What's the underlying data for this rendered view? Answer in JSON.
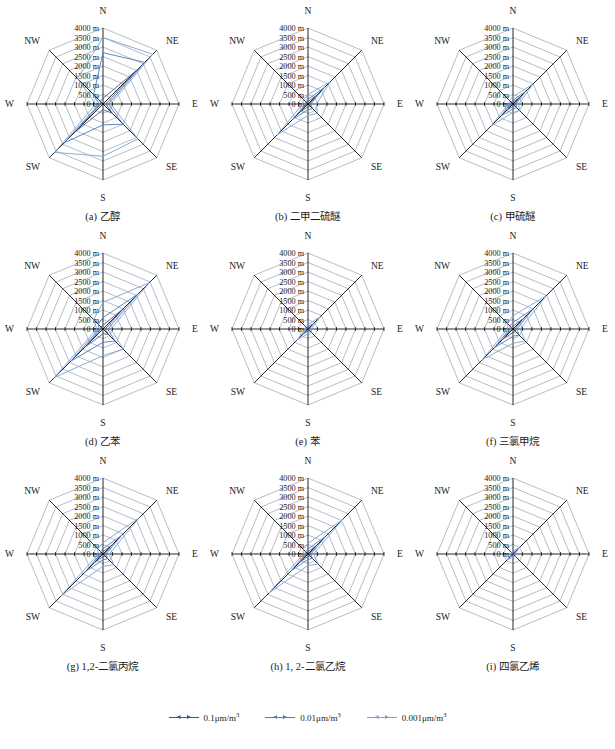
{
  "figure": {
    "rows": 3,
    "cols": 3,
    "grid_color": "#8a8fa3",
    "spoke_color": "#000000",
    "background": "#ffffff"
  },
  "legend": {
    "position": "bottom-center",
    "items": [
      {
        "label": "0.1μm/m",
        "sup": "3",
        "color": "#3d5a8c"
      },
      {
        "label": "0.01μm/m",
        "sup": "3",
        "color": "#4f7ab5"
      },
      {
        "label": "0.001μm/m",
        "sup": "3",
        "color": "#7aa3d4"
      }
    ]
  },
  "axis": {
    "directions": [
      "N",
      "NE",
      "E",
      "SE",
      "S",
      "SW",
      "W",
      "NW"
    ],
    "tick_labels": [
      "4000 m",
      "3500 m",
      "3000 m",
      "2500 m",
      "2000 m",
      "1500 m",
      "1000 m",
      "500 m",
      "0 m"
    ],
    "rmax": 4000,
    "rmin": 0,
    "rstep": 500,
    "units": "m"
  },
  "chart_data": {
    "type": "line",
    "title": "",
    "subtype": "radar",
    "categories": [
      "N",
      "NE",
      "E",
      "SE",
      "S",
      "SW",
      "W",
      "NW"
    ],
    "ylabel": "",
    "xlabel": "",
    "ylim": [
      0,
      4000
    ],
    "grid": true,
    "legend_position": "bottom",
    "series_names": [
      "0.1μm/m3",
      "0.01μm/m3",
      "0.001μm/m3"
    ],
    "panels": [
      {
        "key": "a",
        "caption": "(a) 乙醇",
        "series": [
          {
            "name": "0.1μm/m3",
            "color": "#3d5a8c",
            "values": [
              300,
              2550,
              150,
              700,
              300,
              2100,
              120,
              200
            ]
          },
          {
            "name": "0.01μm/m3",
            "color": "#4f7ab5",
            "values": [
              2700,
              3100,
              280,
              1500,
              1100,
              2900,
              200,
              700
            ]
          },
          {
            "name": "0.001μm/m3",
            "color": "#7aa3d4",
            "values": [
              3500,
              3700,
              400,
              2600,
              2750,
              3600,
              380,
              1900
            ]
          }
        ]
      },
      {
        "key": "b",
        "caption": "(b) 二甲二硫醚",
        "series": [
          {
            "name": "0.1μm/m3",
            "color": "#3d5a8c",
            "values": [
              120,
              700,
              80,
              150,
              150,
              600,
              70,
              80
            ]
          },
          {
            "name": "0.01μm/m3",
            "color": "#4f7ab5",
            "values": [
              250,
              1250,
              140,
              350,
              300,
              1150,
              120,
              160
            ]
          },
          {
            "name": "0.001μm/m3",
            "color": "#7aa3d4",
            "values": [
              500,
              1650,
              450,
              700,
              600,
              2300,
              280,
              320
            ]
          }
        ]
      },
      {
        "key": "c",
        "caption": "(c) 甲硫醚",
        "series": [
          {
            "name": "0.1μm/m3",
            "color": "#3d5a8c",
            "values": [
              100,
              500,
              90,
              140,
              130,
              450,
              80,
              90
            ]
          },
          {
            "name": "0.01μm/m3",
            "color": "#4f7ab5",
            "values": [
              200,
              950,
              160,
              280,
              260,
              900,
              140,
              150
            ]
          },
          {
            "name": "0.001μm/m3",
            "color": "#7aa3d4",
            "values": [
              380,
              1500,
              300,
              480,
              450,
              1650,
              230,
              260
            ]
          }
        ]
      },
      {
        "key": "d",
        "caption": "(d) 乙苯",
        "series": [
          {
            "name": "0.1μm/m3",
            "color": "#3d5a8c",
            "values": [
              200,
              1500,
              120,
              400,
              250,
              1350,
              100,
              150
            ]
          },
          {
            "name": "0.01μm/m3",
            "color": "#4f7ab5",
            "values": [
              600,
              2600,
              250,
              900,
              700,
              2400,
              200,
              350
            ]
          },
          {
            "name": "0.001μm/m3",
            "color": "#7aa3d4",
            "values": [
              1400,
              3450,
              420,
              1500,
              1400,
              3600,
              330,
              700
            ]
          }
        ]
      },
      {
        "key": "e",
        "caption": "(e) 苯",
        "series": [
          {
            "name": "0.1μm/m3",
            "color": "#3d5a8c",
            "values": [
              60,
              200,
              40,
              70,
              60,
              180,
              40,
              45
            ]
          },
          {
            "name": "0.01μm/m3",
            "color": "#4f7ab5",
            "values": [
              120,
              420,
              80,
              140,
              120,
              380,
              70,
              85
            ]
          },
          {
            "name": "0.001μm/m3",
            "color": "#7aa3d4",
            "values": [
              250,
              900,
              160,
              280,
              240,
              800,
              140,
              170
            ]
          }
        ]
      },
      {
        "key": "f",
        "caption": "(f) 三氯甲烷",
        "series": [
          {
            "name": "0.1μm/m3",
            "color": "#3d5a8c",
            "values": [
              150,
              800,
              100,
              200,
              180,
              750,
              90,
              110
            ]
          },
          {
            "name": "0.01μm/m3",
            "color": "#4f7ab5",
            "values": [
              350,
              1500,
              200,
              450,
              380,
              1400,
              170,
              220
            ]
          },
          {
            "name": "0.001μm/m3",
            "color": "#7aa3d4",
            "values": [
              700,
              2450,
              380,
              900,
              750,
              2300,
              300,
              420
            ]
          }
        ]
      },
      {
        "key": "g",
        "caption": "(g) 1,2-二氯丙烷",
        "series": [
          {
            "name": "0.1μm/m3",
            "color": "#3d5a8c",
            "values": [
              120,
              700,
              80,
              150,
              140,
              650,
              70,
              90
            ]
          },
          {
            "name": "0.01μm/m3",
            "color": "#4f7ab5",
            "values": [
              280,
              1400,
              160,
              350,
              300,
              1350,
              140,
              180
            ]
          },
          {
            "name": "0.001μm/m3",
            "color": "#7aa3d4",
            "values": [
              600,
              2700,
              330,
              800,
              650,
              3100,
              260,
              380
            ]
          }
        ]
      },
      {
        "key": "h",
        "caption": "(h) 1, 2-二氯乙烷",
        "series": [
          {
            "name": "0.1μm/m3",
            "color": "#3d5a8c",
            "values": [
              110,
              650,
              70,
              140,
              130,
              600,
              65,
              85
            ]
          },
          {
            "name": "0.01μm/m3",
            "color": "#4f7ab5",
            "values": [
              260,
              1300,
              150,
              320,
              280,
              1250,
              130,
              170
            ]
          },
          {
            "name": "0.001μm/m3",
            "color": "#7aa3d4",
            "values": [
              560,
              2550,
              300,
              750,
              600,
              2900,
              240,
              350
            ]
          }
        ]
      },
      {
        "key": "i",
        "caption": "(i) 四氯乙烯",
        "series": [
          {
            "name": "0.1μm/m3",
            "color": "#3d5a8c",
            "values": [
              40,
              110,
              30,
              45,
              40,
              100,
              28,
              32
            ]
          },
          {
            "name": "0.01μm/m3",
            "color": "#4f7ab5",
            "values": [
              80,
              230,
              55,
              90,
              80,
              210,
              50,
              60
            ]
          },
          {
            "name": "0.001μm/m3",
            "color": "#7aa3d4",
            "values": [
              160,
              480,
              110,
              180,
              160,
              430,
              95,
              115
            ]
          }
        ]
      }
    ]
  }
}
